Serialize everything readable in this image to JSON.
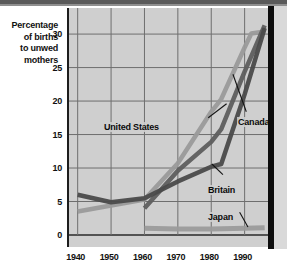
{
  "chart_data": {
    "type": "line",
    "title": "",
    "ylabel": "Percentage of births to unwed mothers",
    "xlabel": "",
    "ylim": [
      0,
      33
    ],
    "xlim": [
      1938,
      1997
    ],
    "yticks": [
      0,
      5,
      10,
      15,
      20,
      25,
      30
    ],
    "xticks": [
      1940,
      1950,
      1960,
      1970,
      1980,
      1990
    ],
    "grid": true,
    "legend_position": "inline-annotations",
    "series": [
      {
        "name": "United States",
        "color": "#9a9a9a",
        "x": [
          1940,
          1950,
          1960,
          1970,
          1980,
          1983,
          1990,
          1992,
          1996
        ],
        "values": [
          3.5,
          4.4,
          5.3,
          10.7,
          18.4,
          20.3,
          28.0,
          30.1,
          30.4
        ]
      },
      {
        "name": "Canada",
        "color": "#5e5e5e",
        "x": [
          1960,
          1970,
          1980,
          1983,
          1990,
          1996
        ],
        "values": [
          4.0,
          9.6,
          13.9,
          15.8,
          24.4,
          31.3
        ]
      },
      {
        "name": "Britain",
        "color": "#4a4a4a",
        "x": [
          1940,
          1950,
          1960,
          1970,
          1980,
          1983,
          1990,
          1996
        ],
        "values": [
          6.0,
          4.9,
          5.5,
          8.0,
          10.2,
          10.6,
          21.0,
          30.9
        ]
      },
      {
        "name": "Japan",
        "color": "#9b9b9b",
        "x": [
          1960,
          1970,
          1980,
          1990,
          1996
        ],
        "values": [
          1.0,
          0.9,
          0.9,
          1.0,
          1.1
        ]
      }
    ],
    "annotations": [
      {
        "label": "United States",
        "target_series": "United States"
      },
      {
        "label": "Canada",
        "target_series": "Canada"
      },
      {
        "label": "Britain",
        "target_series": "Britain"
      },
      {
        "label": "Japan",
        "target_series": "Japan"
      }
    ]
  },
  "axis": {
    "ylabel_lines": [
      "Percentage",
      "of births",
      "to unwed",
      "mothers"
    ],
    "ytick_labels": [
      "30",
      "25",
      "20",
      "15",
      "10",
      "5",
      "0"
    ],
    "xtick_labels": [
      "1940",
      "1950",
      "1960",
      "1970",
      "1980",
      "1990"
    ]
  },
  "labels": {
    "united_states": "United States",
    "canada": "Canada",
    "britain": "Britain",
    "japan": "Japan"
  }
}
